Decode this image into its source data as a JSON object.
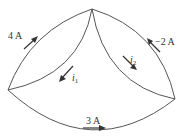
{
  "diagram": {
    "type": "circuit-node-currents",
    "nodes": {
      "top": [
        92,
        9
      ],
      "left": [
        8,
        90
      ],
      "right": [
        175,
        99
      ]
    },
    "branches": [
      {
        "id": "left-outer",
        "from": "left",
        "to": "top",
        "current_label": "4 A",
        "direction": "toward-top"
      },
      {
        "id": "right-outer",
        "from": "right",
        "to": "top",
        "current_label": "−2 A",
        "direction": "toward-top"
      },
      {
        "id": "left-inner",
        "from": "top",
        "to": "left",
        "current_label": "i",
        "subscript": "1",
        "direction": "toward-left"
      },
      {
        "id": "right-inner",
        "from": "top",
        "to": "right",
        "current_label": "i",
        "subscript": "2",
        "direction": "toward-right"
      },
      {
        "id": "bottom",
        "from": "left",
        "to": "right",
        "current_label": "3 A",
        "direction": "toward-right"
      }
    ],
    "labels": {
      "left_outer": "4 A",
      "right_outer": "−2 A",
      "i1_symbol": "i",
      "i1_sub": "1",
      "i2_symbol": "i",
      "i2_sub": "2",
      "bottom": "3 A"
    },
    "colors": {
      "wire": "#555555",
      "arrow": "#333333",
      "text": "#333333",
      "background": "#ffffff"
    }
  }
}
